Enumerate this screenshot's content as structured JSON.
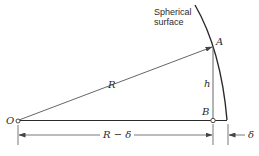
{
  "diagram": {
    "title_label_line1": "Spherical",
    "title_label_line2": "surface",
    "points": {
      "O": "O",
      "A": "A",
      "B": "B"
    },
    "labels": {
      "radius": "R",
      "height": "h",
      "base_length": "R − δ",
      "sag": "δ"
    },
    "colors": {
      "line": "#2a2a2a",
      "thin_line": "#555555",
      "background": "#ffffff"
    }
  }
}
